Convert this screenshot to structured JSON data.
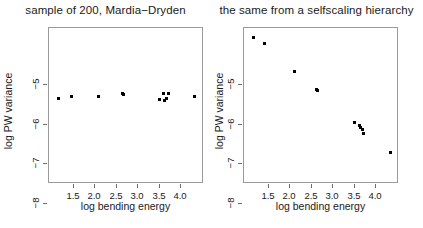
{
  "figure": {
    "background": "#ffffff",
    "point_color": "#000000",
    "frame_color": "#9a9a9a"
  },
  "chart_data": [
    {
      "type": "scatter",
      "title": "sample of 200, Mardia−Dryden",
      "xlabel": "log bending energy",
      "ylabel": "log PW variance",
      "xlim": [
        1.32,
        4.42
      ],
      "ylim": [
        -8.22,
        -4.62
      ],
      "xticks": [
        1.5,
        2.0,
        2.5,
        3.0,
        3.5,
        4.0
      ],
      "xticklabels": [
        "1.5",
        "2.0",
        "2.5",
        "3.0",
        "3.5",
        "4.0"
      ],
      "yticks": [
        -5,
        -6,
        -7,
        -8
      ],
      "yticklabels": [
        "−5",
        "−6",
        "−7",
        "−8"
      ],
      "grid": false,
      "legend": null,
      "x": [
        1.5,
        1.76,
        2.31,
        2.78,
        2.8,
        3.52,
        3.6,
        3.63,
        3.66,
        3.71,
        4.22
      ],
      "y": [
        -6.24,
        -6.21,
        -6.19,
        -6.13,
        -6.15,
        -6.27,
        -6.13,
        -6.3,
        -6.25,
        -6.14,
        -6.21
      ]
    },
    {
      "type": "scatter",
      "title": "the same from a selfscaling hierarchy",
      "xlabel": "log bending energy",
      "ylabel": "log PW variance",
      "xlim": [
        1.32,
        4.42
      ],
      "ylim": [
        -8.22,
        -4.62
      ],
      "xticks": [
        1.5,
        2.0,
        2.5,
        3.0,
        3.5,
        4.0
      ],
      "xticklabels": [
        "1.5",
        "2.0",
        "2.5",
        "3.0",
        "3.5",
        "4.0"
      ],
      "yticks": [
        -5,
        -6,
        -7,
        -8
      ],
      "yticklabels": [
        "−5",
        "−6",
        "−7",
        "−8"
      ],
      "grid": false,
      "legend": null,
      "x": [
        1.5,
        1.72,
        2.32,
        2.76,
        2.79,
        3.52,
        3.62,
        3.65,
        3.68,
        3.71,
        4.24
      ],
      "y": [
        -4.83,
        -4.97,
        -5.63,
        -6.03,
        -6.06,
        -6.8,
        -6.88,
        -6.92,
        -6.96,
        -7.06,
        -7.5
      ]
    }
  ]
}
